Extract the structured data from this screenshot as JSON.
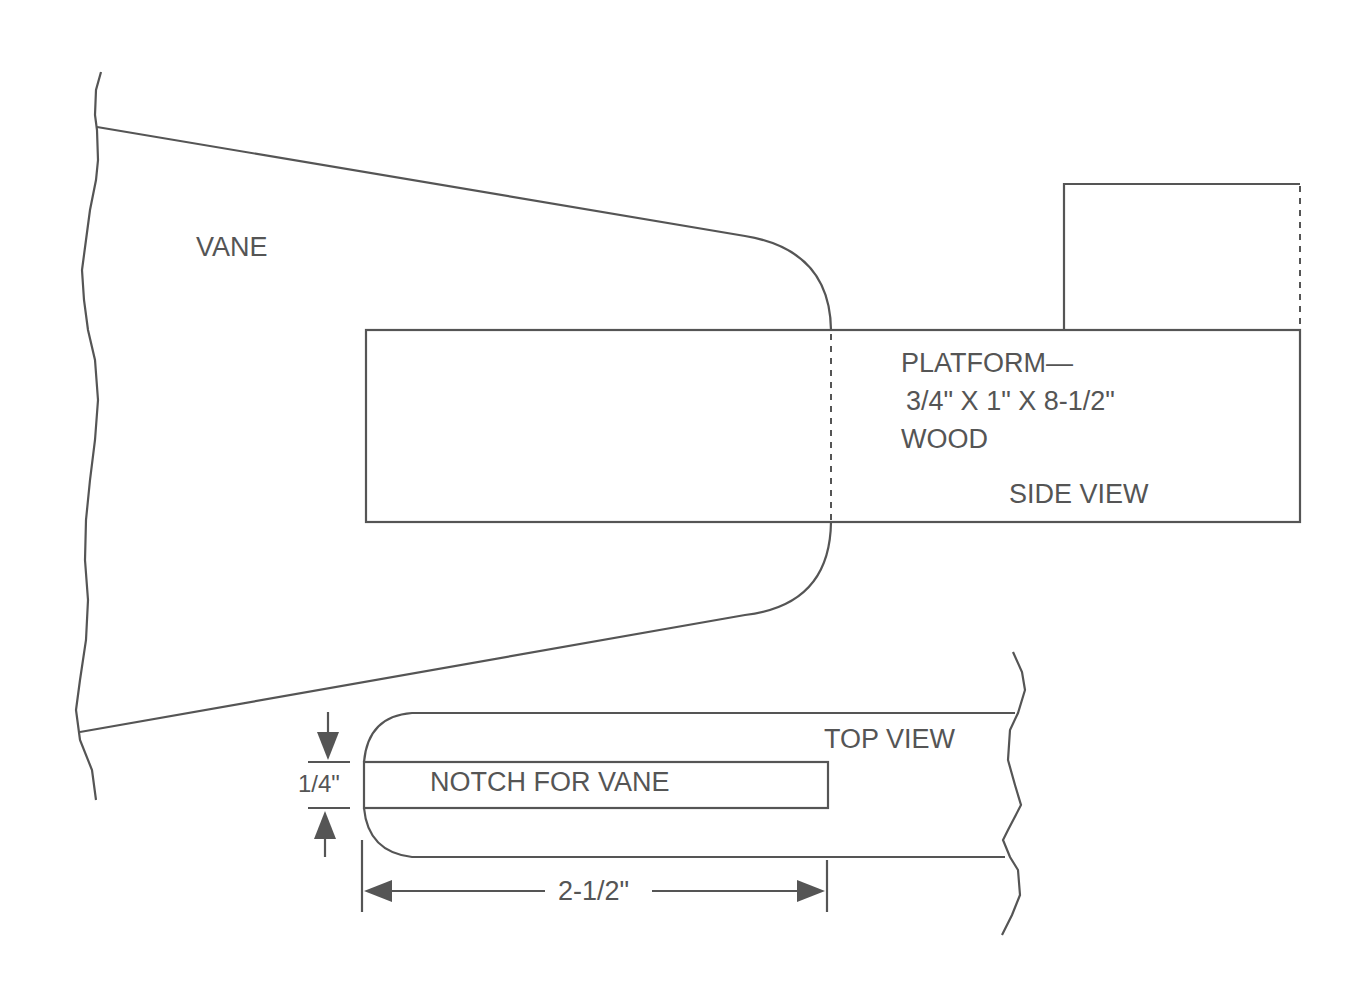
{
  "labels": {
    "vane": "VANE",
    "platform_title": "PLATFORM—",
    "platform_dims": "3/4\" X 1\" X 8-1/2\"",
    "platform_material": "WOOD",
    "side_view": "SIDE VIEW",
    "top_view": "TOP VIEW",
    "notch": "NOTCH FOR VANE",
    "notch_width": "1/4\"",
    "notch_length": "2-1/2\""
  },
  "colors": {
    "line": "#555555",
    "background": "#ffffff"
  }
}
